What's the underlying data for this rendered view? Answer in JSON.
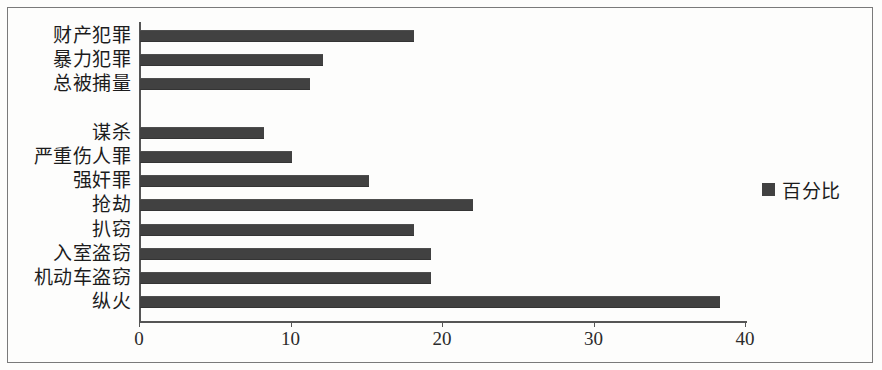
{
  "legend": {
    "label": "百分比",
    "swatch_color": "#414141",
    "position": "right"
  },
  "axis": {
    "x_ticks": [
      "0",
      "10",
      "20",
      "30",
      "40"
    ],
    "x_min": 0,
    "x_max": 40
  },
  "colors": {
    "bar": "#414141",
    "axis": "#555555",
    "text": "#1c1c1c",
    "frame": "#7a7a7a",
    "background": "#fdfdfc"
  },
  "chart_data": {
    "type": "bar",
    "orientation": "horizontal",
    "title": "",
    "xlabel": "",
    "ylabel": "",
    "xlim": [
      0,
      40
    ],
    "grid": false,
    "legend_position": "right",
    "series": [
      {
        "name": "百分比",
        "color": "#414141",
        "values": [
          18.1,
          12.1,
          11.2,
          null,
          8.2,
          10.0,
          15.1,
          22.0,
          18.1,
          19.2,
          19.2,
          38.3
        ]
      }
    ],
    "categories": [
      "财产犯罪",
      "暴力犯罪",
      "总被捕量",
      "",
      "谋杀",
      "严重伤人罪",
      "强奸罪",
      "抢劫",
      "扒窃",
      "入室盗窃",
      "机动车盗窃",
      "纵火"
    ],
    "points": [
      {
        "category": "财产犯罪",
        "value": 18.1
      },
      {
        "category": "暴力犯罪",
        "value": 12.1
      },
      {
        "category": "总被捕量",
        "value": 11.2
      },
      {
        "category": "",
        "value": null
      },
      {
        "category": "谋杀",
        "value": 8.2
      },
      {
        "category": "严重伤人罪",
        "value": 10.0
      },
      {
        "category": "强奸罪",
        "value": 15.1
      },
      {
        "category": "抢劫",
        "value": 22.0
      },
      {
        "category": "扒窃",
        "value": 18.1
      },
      {
        "category": "入室盗窃",
        "value": 19.2
      },
      {
        "category": "机动车盗窃",
        "value": 19.2
      },
      {
        "category": "纵火",
        "value": 38.3
      }
    ]
  }
}
